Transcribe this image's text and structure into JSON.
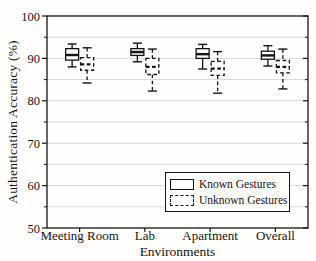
{
  "figure": {
    "ylabel": "Authentication Accuracy (%)",
    "xlabel": "Environments"
  },
  "legend": {
    "items": [
      {
        "label": "Known Gestures",
        "style": "solid"
      },
      {
        "label": "Unknown Gestures",
        "style": "dashed"
      }
    ]
  },
  "colors": {
    "line": "#141414",
    "grid": "#d8d8d8",
    "background": "#fffefd"
  },
  "chart_data": {
    "type": "boxplot",
    "title": "",
    "xlabel": "Environments",
    "ylabel": "Authentication Accuracy (%)",
    "categories": [
      "Meeting Room",
      "Lab",
      "Apartment",
      "Overall"
    ],
    "ylim": [
      50,
      100
    ],
    "yticks": [
      50,
      60,
      70,
      80,
      90,
      100
    ],
    "minor_tick_step": 5,
    "grid": true,
    "grid_step": 5,
    "legend_position": "lower right",
    "series": [
      {
        "name": "Known Gestures",
        "line_style": "solid",
        "boxes": [
          {
            "category": "Meeting Room",
            "whisker_low": 88.0,
            "q1": 89.6,
            "median": 90.8,
            "q3": 92.3,
            "whisker_high": 93.4
          },
          {
            "category": "Lab",
            "whisker_low": 89.2,
            "q1": 90.7,
            "median": 91.5,
            "q3": 92.3,
            "whisker_high": 93.6
          },
          {
            "category": "Apartment",
            "whisker_low": 87.5,
            "q1": 90.0,
            "median": 91.0,
            "q3": 92.3,
            "whisker_high": 93.3
          },
          {
            "category": "Overall",
            "whisker_low": 88.2,
            "q1": 89.8,
            "median": 90.7,
            "q3": 91.7,
            "whisker_high": 93.0
          }
        ]
      },
      {
        "name": "Unknown Gestures",
        "line_style": "dashed",
        "boxes": [
          {
            "category": "Meeting Room",
            "whisker_low": 84.2,
            "q1": 87.2,
            "median": 88.6,
            "q3": 90.2,
            "whisker_high": 92.5
          },
          {
            "category": "Lab",
            "whisker_low": 82.3,
            "q1": 86.2,
            "median": 88.0,
            "q3": 90.0,
            "whisker_high": 92.2
          },
          {
            "category": "Apartment",
            "whisker_low": 81.8,
            "q1": 86.0,
            "median": 87.6,
            "q3": 89.3,
            "whisker_high": 91.6
          },
          {
            "category": "Overall",
            "whisker_low": 82.8,
            "q1": 86.6,
            "median": 88.0,
            "q3": 89.5,
            "whisker_high": 92.2
          }
        ]
      }
    ]
  }
}
